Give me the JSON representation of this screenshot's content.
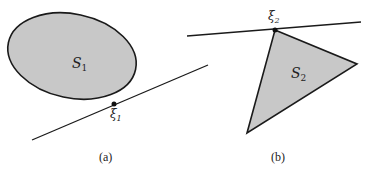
{
  "figure": {
    "panels": [
      {
        "id": "a",
        "caption": "(a)",
        "shape": "ellipse",
        "set_label": "S",
        "set_subscript": "1",
        "point_label": "ξ",
        "point_subscript": "1"
      },
      {
        "id": "b",
        "caption": "(b)",
        "shape": "triangle",
        "set_label": "S",
        "set_subscript": "2",
        "point_label": "ξ",
        "point_subscript": "2"
      }
    ],
    "colors": {
      "fill": "#c8c8c8",
      "stroke": "#1a1a1a",
      "background": "#ffffff"
    }
  }
}
